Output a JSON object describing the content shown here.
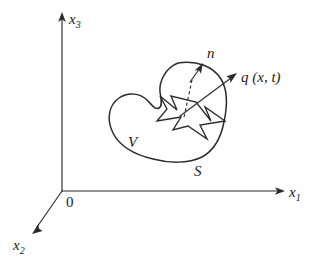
{
  "figure": {
    "type": "line-diagram",
    "background_color": "#ffffff",
    "ink_color": "#2b2b2b",
    "width": 320,
    "height": 267
  },
  "axes": {
    "origin_label": "0",
    "origin_point": [
      62,
      191
    ],
    "items": [
      {
        "id": "x3",
        "base": "x",
        "subscript": "3",
        "label": "x3",
        "direction": "up",
        "from": [
          62,
          191
        ],
        "to": [
          62,
          14
        ],
        "label_pos": [
          70,
          22
        ]
      },
      {
        "id": "x1",
        "base": "x",
        "subscript": "1",
        "label": "x1",
        "direction": "right",
        "from": [
          62,
          191
        ],
        "to": [
          283,
          191
        ],
        "label_pos": [
          289,
          197
        ]
      },
      {
        "id": "x2",
        "base": "x",
        "subscript": "2",
        "label": "x2",
        "direction": "down-left",
        "from": [
          62,
          191
        ],
        "to": [
          33,
          232
        ],
        "label_pos": [
          15,
          250
        ]
      }
    ]
  },
  "body": {
    "volume_label": "V",
    "volume_label_pos": [
      130,
      145
    ],
    "surface_label": "S",
    "surface_label_pos": [
      195,
      174
    ],
    "shape": "kidney-bean"
  },
  "vectors": [
    {
      "id": "normal",
      "label": "n",
      "label_pos": [
        208,
        56
      ],
      "description": "outward unit normal at surface point",
      "tail": [
        190,
        83
      ],
      "tip": [
        202,
        66
      ],
      "dashed_from": [
        186,
        116
      ],
      "dashed_to": [
        192,
        80
      ]
    },
    {
      "id": "flux",
      "label": "q (x, t)",
      "label_pos": [
        243,
        80
      ],
      "description": "flux vector field through the surface",
      "tail": [
        181,
        115
      ],
      "tip": [
        236,
        74
      ]
    }
  ],
  "inner_dart": {
    "description": "dart / arrow-shaped region drawn inside the body",
    "label": ""
  }
}
